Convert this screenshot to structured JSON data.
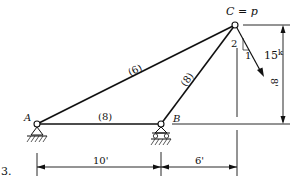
{
  "problem_number": "3.",
  "joints": {
    "A": {
      "label": "A"
    },
    "B": {
      "label": "B"
    },
    "C": {
      "label": "C = p"
    }
  },
  "members": {
    "AC": {
      "label": "(6)"
    },
    "AB": {
      "label": "(8)"
    },
    "BC": {
      "label": "(8)"
    }
  },
  "load": {
    "magnitude": "15",
    "unit": "k",
    "slope_rise": "2",
    "slope_run": "1"
  },
  "dimensions": {
    "horizontal_AB": "10'",
    "horizontal_BC": "6'",
    "vertical": "8'"
  },
  "colors": {
    "line": "#111111",
    "background": "#ffffff"
  }
}
